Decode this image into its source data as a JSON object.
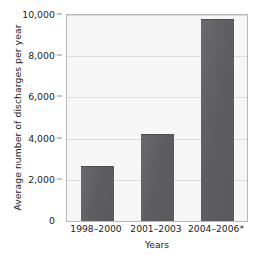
{
  "chart_data": {
    "type": "bar",
    "title": "",
    "xlabel": "Years",
    "ylabel": "Average number of discharges per year",
    "categories": [
      "1998–2000",
      "2001–2003",
      "2004–2006*"
    ],
    "values": [
      2650,
      4200,
      9800
    ],
    "ylim": [
      0,
      10000
    ],
    "yticks": [
      0,
      2000,
      4000,
      6000,
      8000,
      10000
    ],
    "ytick_labels": [
      "0",
      "2,000",
      "4,000",
      "6,000",
      "8,000",
      "10,000"
    ],
    "grid": true,
    "legend": "none",
    "bar_color": "#5e5e62",
    "plot_background": "#f7f7f7",
    "axis_color": "#b9b9b9",
    "gridline_color": "#dcdcdc"
  }
}
